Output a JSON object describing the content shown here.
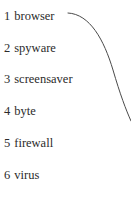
{
  "page": {
    "background_color": "#ffffff",
    "width": 131,
    "height": 202
  },
  "list": {
    "text_color": "#2b2b2b",
    "items": [
      {
        "number": "1",
        "label": "browser"
      },
      {
        "number": "2",
        "label": "spyware"
      },
      {
        "number": "3",
        "label": "screensaver"
      },
      {
        "number": "4",
        "label": "byte"
      },
      {
        "number": "5",
        "label": "firewall"
      },
      {
        "number": "6",
        "label": "virus"
      }
    ]
  },
  "annotation": {
    "curve": {
      "name": "matching-curve-line",
      "color": "#4a4a4a",
      "stroke_width": 1,
      "start": [
        68,
        13
      ],
      "end": [
        131,
        121
      ]
    }
  }
}
